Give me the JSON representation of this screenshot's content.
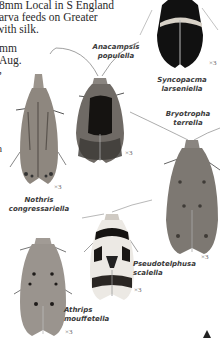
{
  "page": {
    "type": "field-guide-plate",
    "text_lines": [
      "8mm Local in S England",
      "arva feeds on Greater",
      "  with silk.",
      "mm",
      "Aug.",
      ","
    ],
    "fragment_mid": "n"
  },
  "species": [
    {
      "id": "syncopacma",
      "name_line1": "Syncopacma",
      "name_line2": "larseniella",
      "scale": "×3"
    },
    {
      "id": "anacampsis",
      "name_line1": "Anacampsis",
      "name_line2": "populella",
      "scale": "×3"
    },
    {
      "id": "bryotropha",
      "name_line1": "Bryotropha",
      "name_line2": "terrella",
      "scale": "×3"
    },
    {
      "id": "nothris",
      "name_line1": "Nothris",
      "name_line2": "congressariella",
      "scale": "×3"
    },
    {
      "id": "pseudotelphusa",
      "name_line1": "Pseudotelphusa",
      "name_line2": "scalella",
      "scale": "×3"
    },
    {
      "id": "athrips",
      "name_line1": "Athrips",
      "name_line2": "mouffetella",
      "scale": "×3"
    }
  ],
  "colors": {
    "background": "#ffffff",
    "text": "#2a2a2a",
    "caption": "#3a3a3a"
  }
}
